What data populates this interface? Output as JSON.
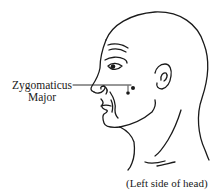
{
  "diagram": {
    "type": "anatomical-line-drawing",
    "labels": [
      {
        "id": "zygomaticus",
        "line1": "Zygomaticus",
        "line2": "Major"
      }
    ],
    "markers": [
      {
        "name": "electrode-dot-upper",
        "x": 133,
        "y": 88
      },
      {
        "name": "electrode-dot-lower",
        "x": 128,
        "y": 93
      }
    ],
    "caption": "(Left side of head)",
    "colors": {
      "line": "#1a1a1a",
      "background": "#ffffff"
    }
  }
}
